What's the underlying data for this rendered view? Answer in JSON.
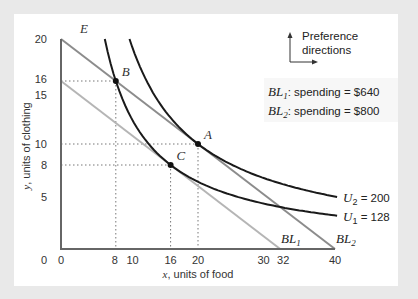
{
  "chart_data": {
    "type": "line",
    "title": "",
    "xlabel": "x, units of food",
    "xlabel_var": "x",
    "xlabel_rest": ", units of food",
    "ylabel": "y, units of clothing",
    "ylabel_var": "y",
    "ylabel_rest": ", units of clothing",
    "xlim": [
      0,
      40
    ],
    "ylim": [
      0,
      20
    ],
    "grid": false,
    "x_ticks": [
      0,
      8,
      10,
      16,
      20,
      30,
      32,
      40
    ],
    "y_ticks": [
      5,
      8,
      10,
      15,
      16,
      20
    ],
    "budget_lines": [
      {
        "name": "BL1",
        "base": "BL",
        "sub": "1",
        "x_intercept": 32,
        "y_intercept": 16,
        "color": "#b5b5b5",
        "spending": "$640"
      },
      {
        "name": "BL2",
        "base": "BL",
        "sub": "2",
        "x_intercept": 40,
        "y_intercept": 20,
        "color": "#8c8c8c",
        "spending": "$800"
      }
    ],
    "indifference_curves": [
      {
        "name": "U2",
        "base": "U",
        "sub": "2",
        "utility": 200,
        "label_value": "= 200",
        "formula": "U = x*y",
        "x_range": [
          10,
          40.3
        ],
        "color": "#1a1a1a"
      },
      {
        "name": "U1",
        "base": "U",
        "sub": "1",
        "utility": 128,
        "label_value": "= 128",
        "formula": "U = x*y",
        "x_range": [
          6.4,
          40.3
        ],
        "color": "#1a1a1a"
      }
    ],
    "points": [
      {
        "name": "A",
        "x": 20,
        "y": 10
      },
      {
        "name": "B",
        "x": 8,
        "y": 16
      },
      {
        "name": "C",
        "x": 16,
        "y": 8
      }
    ],
    "guide_lines": [
      {
        "x": 8,
        "y": 16
      },
      {
        "x": 20,
        "y": 10
      },
      {
        "x": 16,
        "y": 8
      }
    ],
    "annotations": {
      "E_label": "E",
      "preference_line1": "Preference",
      "preference_line2": "directions",
      "legend": [
        {
          "base": "BL",
          "sub": "1",
          "text": ": spending = $640"
        },
        {
          "base": "BL",
          "sub": "2",
          "text": ": spending = $800"
        }
      ]
    }
  }
}
